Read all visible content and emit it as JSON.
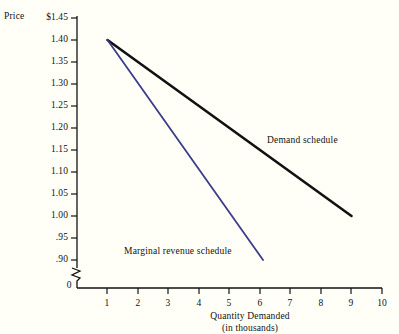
{
  "chart_data": {
    "type": "line",
    "title": "",
    "xlabel": "Quantity Demanded (in thousands)",
    "xlabel_line1": "Quantity Demanded",
    "xlabel_line2": "(in thousands)",
    "ylabel": "Price",
    "xlim": [
      0,
      10
    ],
    "ylim": [
      0.9,
      1.45
    ],
    "grid": false,
    "axis_break_y": true,
    "legend_position": "inline-annotations",
    "x_ticks": [
      1,
      2,
      3,
      4,
      5,
      6,
      7,
      8,
      9,
      10
    ],
    "x_tick_labels": [
      "1",
      "2",
      "3",
      "4",
      "5",
      "6",
      "7",
      "8",
      "9",
      "10"
    ],
    "y_ticks": [
      0.9,
      0.95,
      1.0,
      1.05,
      1.1,
      1.15,
      1.2,
      1.25,
      1.3,
      1.35,
      1.4,
      1.45
    ],
    "y_tick_labels": [
      ".90",
      ".95",
      "1.00",
      "1.05",
      "1.10",
      "1.15",
      "1.20",
      "1.25",
      "1.30",
      "1.35",
      "1.40",
      "$1.45"
    ],
    "origin_label": "0",
    "series": [
      {
        "name": "Demand schedule",
        "color": "#111111",
        "width": 2.6,
        "x": [
          1,
          9
        ],
        "values": [
          1.4,
          1.0
        ],
        "label_x": 5.8,
        "label_y": 1.165
      },
      {
        "name": "Marginal revenue schedule",
        "color": "#3c3c8c",
        "width": 1.8,
        "x": [
          1,
          6.1
        ],
        "values": [
          1.4,
          0.9
        ],
        "label_x": 2.1,
        "label_y": 0.955
      }
    ]
  },
  "annotations": {
    "price_axis_title": "Price",
    "demand_label": "Demand schedule",
    "marginal_revenue_label": "Marginal revenue schedule"
  }
}
